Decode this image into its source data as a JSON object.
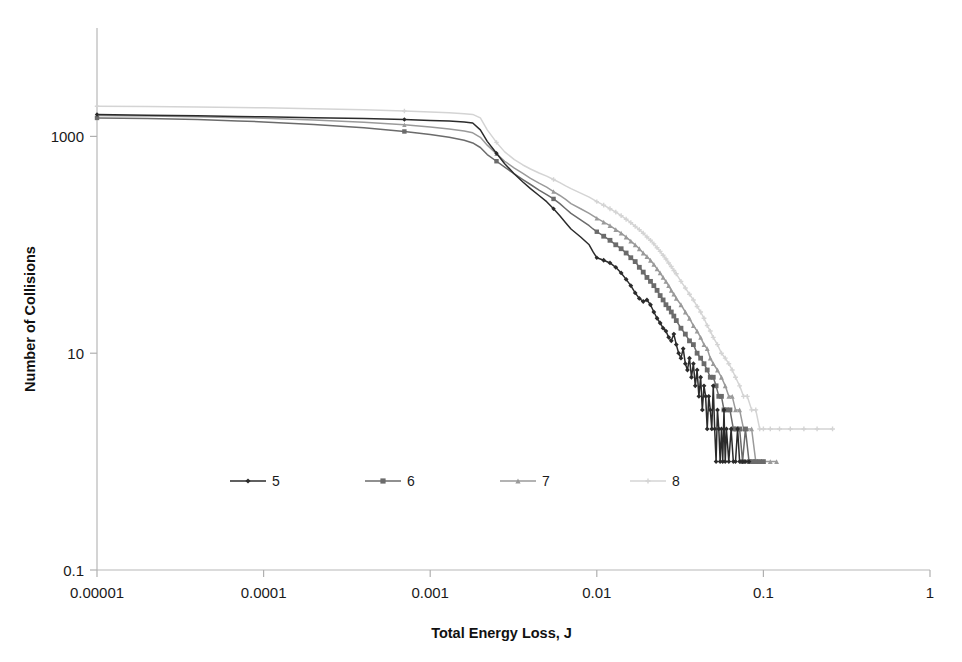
{
  "chart_data": {
    "type": "line",
    "title": "",
    "xlabel": "Total Energy Loss, J",
    "ylabel": "Number of Collisions",
    "xscale": "log",
    "yscale": "log",
    "xlim": [
      1e-05,
      1
    ],
    "ylim": [
      0.1,
      10000
    ],
    "xticks": [
      "0.00001",
      "0.0001",
      "0.001",
      "0.01",
      "0.1",
      "1"
    ],
    "xtick_values": [
      1e-05,
      0.0001,
      0.001,
      0.01,
      0.1,
      1
    ],
    "yticks": [
      "0.1",
      "10",
      "1000"
    ],
    "ytick_values": [
      0.1,
      10,
      1000
    ],
    "grid": false,
    "legend_position": "inside-lower-left",
    "legend_entries": [
      "5",
      "6",
      "7",
      "8"
    ],
    "series": [
      {
        "name": "5",
        "color": "#2b2b2b",
        "marker": "diamond",
        "points": [
          [
            1e-05,
            1590
          ],
          [
            2e-05,
            1570
          ],
          [
            4e-05,
            1550
          ],
          [
            7e-05,
            1530
          ],
          [
            0.0001,
            1515
          ],
          [
            0.0002,
            1490
          ],
          [
            0.0004,
            1460
          ],
          [
            0.0007,
            1430
          ],
          [
            0.001,
            1405
          ],
          [
            0.0013,
            1385
          ],
          [
            0.0016,
            1360
          ],
          [
            0.0018,
            1330
          ],
          [
            0.002,
            1150
          ],
          [
            0.0022,
            900
          ],
          [
            0.0025,
            700
          ],
          [
            0.0028,
            560
          ],
          [
            0.0032,
            450
          ],
          [
            0.0036,
            380
          ],
          [
            0.004,
            330
          ],
          [
            0.0045,
            285
          ],
          [
            0.005,
            250
          ],
          [
            0.0055,
            215
          ],
          [
            0.006,
            185
          ],
          [
            0.0065,
            160
          ],
          [
            0.007,
            140
          ],
          [
            0.008,
            118
          ],
          [
            0.009,
            100
          ],
          [
            0.0095,
            86
          ],
          [
            0.01,
            76
          ],
          [
            0.011,
            72
          ],
          [
            0.012,
            68
          ],
          [
            0.013,
            62
          ],
          [
            0.014,
            55
          ],
          [
            0.015,
            48
          ],
          [
            0.016,
            42
          ],
          [
            0.017,
            36
          ],
          [
            0.018,
            32
          ],
          [
            0.019,
            30
          ],
          [
            0.02,
            31
          ],
          [
            0.021,
            28
          ],
          [
            0.022,
            24
          ],
          [
            0.023,
            21
          ],
          [
            0.024,
            19
          ],
          [
            0.025,
            17
          ],
          [
            0.026,
            16
          ],
          [
            0.027,
            14
          ],
          [
            0.028,
            13
          ],
          [
            0.029,
            15
          ],
          [
            0.03,
            12
          ],
          [
            0.031,
            10
          ],
          [
            0.032,
            9
          ],
          [
            0.033,
            11
          ],
          [
            0.034,
            8
          ],
          [
            0.035,
            7
          ],
          [
            0.036,
            9
          ],
          [
            0.037,
            6
          ],
          [
            0.038,
            8
          ],
          [
            0.039,
            5
          ],
          [
            0.04,
            7
          ],
          [
            0.041,
            4
          ],
          [
            0.042,
            6
          ],
          [
            0.043,
            3
          ],
          [
            0.044,
            5
          ],
          [
            0.045,
            4
          ],
          [
            0.046,
            2
          ],
          [
            0.047,
            4
          ],
          [
            0.048,
            3
          ],
          [
            0.049,
            2
          ],
          [
            0.05,
            5
          ],
          [
            0.051,
            2
          ],
          [
            0.052,
            1
          ],
          [
            0.053,
            3
          ],
          [
            0.054,
            2
          ],
          [
            0.055,
            1
          ],
          [
            0.056,
            2
          ],
          [
            0.057,
            1
          ],
          [
            0.058,
            3
          ],
          [
            0.059,
            1
          ],
          [
            0.06,
            2
          ],
          [
            0.062,
            1
          ],
          [
            0.064,
            2
          ],
          [
            0.066,
            1
          ],
          [
            0.068,
            1
          ],
          [
            0.07,
            2
          ],
          [
            0.072,
            1
          ],
          [
            0.075,
            1
          ],
          [
            0.078,
            1
          ],
          [
            0.082,
            1
          ]
        ]
      },
      {
        "name": "6",
        "color": "#6b6b6b",
        "marker": "square",
        "points": [
          [
            1e-05,
            1480
          ],
          [
            2e-05,
            1460
          ],
          [
            4e-05,
            1430
          ],
          [
            7e-05,
            1390
          ],
          [
            0.0001,
            1360
          ],
          [
            0.0002,
            1290
          ],
          [
            0.0004,
            1200
          ],
          [
            0.0007,
            1110
          ],
          [
            0.001,
            1040
          ],
          [
            0.0013,
            980
          ],
          [
            0.0016,
            920
          ],
          [
            0.0018,
            870
          ],
          [
            0.002,
            790
          ],
          [
            0.0022,
            680
          ],
          [
            0.0025,
            590
          ],
          [
            0.0028,
            520
          ],
          [
            0.0032,
            450
          ],
          [
            0.0036,
            400
          ],
          [
            0.004,
            360
          ],
          [
            0.0045,
            320
          ],
          [
            0.005,
            290
          ],
          [
            0.0055,
            265
          ],
          [
            0.006,
            240
          ],
          [
            0.0065,
            215
          ],
          [
            0.007,
            195
          ],
          [
            0.008,
            170
          ],
          [
            0.009,
            150
          ],
          [
            0.0095,
            140
          ],
          [
            0.01,
            132
          ],
          [
            0.011,
            120
          ],
          [
            0.012,
            110
          ],
          [
            0.013,
            100
          ],
          [
            0.014,
            92
          ],
          [
            0.015,
            84
          ],
          [
            0.016,
            76
          ],
          [
            0.017,
            70
          ],
          [
            0.018,
            62
          ],
          [
            0.019,
            56
          ],
          [
            0.02,
            50
          ],
          [
            0.021,
            46
          ],
          [
            0.022,
            42
          ],
          [
            0.023,
            38
          ],
          [
            0.024,
            34
          ],
          [
            0.025,
            31
          ],
          [
            0.026,
            28
          ],
          [
            0.027,
            26
          ],
          [
            0.028,
            24
          ],
          [
            0.029,
            22
          ],
          [
            0.03,
            20
          ],
          [
            0.032,
            17
          ],
          [
            0.034,
            15
          ],
          [
            0.036,
            13
          ],
          [
            0.038,
            12
          ],
          [
            0.04,
            10
          ],
          [
            0.042,
            9
          ],
          [
            0.044,
            8
          ],
          [
            0.046,
            7
          ],
          [
            0.048,
            6
          ],
          [
            0.05,
            6
          ],
          [
            0.052,
            5
          ],
          [
            0.054,
            4
          ],
          [
            0.056,
            4
          ],
          [
            0.058,
            3
          ],
          [
            0.06,
            3
          ],
          [
            0.063,
            3
          ],
          [
            0.066,
            2
          ],
          [
            0.069,
            2
          ],
          [
            0.072,
            2
          ],
          [
            0.075,
            1
          ],
          [
            0.078,
            2
          ],
          [
            0.082,
            1
          ],
          [
            0.086,
            1
          ],
          [
            0.09,
            1
          ],
          [
            0.095,
            1
          ],
          [
            0.1,
            1
          ]
        ]
      },
      {
        "name": "7",
        "color": "#9a9a9a",
        "marker": "triangle",
        "points": [
          [
            1e-05,
            1560
          ],
          [
            2e-05,
            1545
          ],
          [
            4e-05,
            1520
          ],
          [
            7e-05,
            1490
          ],
          [
            0.0001,
            1470
          ],
          [
            0.0002,
            1420
          ],
          [
            0.0004,
            1350
          ],
          [
            0.0007,
            1280
          ],
          [
            0.001,
            1220
          ],
          [
            0.0013,
            1170
          ],
          [
            0.0016,
            1120
          ],
          [
            0.0018,
            1080
          ],
          [
            0.002,
            980
          ],
          [
            0.0022,
            830
          ],
          [
            0.0025,
            690
          ],
          [
            0.0028,
            590
          ],
          [
            0.0032,
            510
          ],
          [
            0.0036,
            455
          ],
          [
            0.004,
            410
          ],
          [
            0.0045,
            370
          ],
          [
            0.005,
            340
          ],
          [
            0.0055,
            310
          ],
          [
            0.006,
            285
          ],
          [
            0.0065,
            262
          ],
          [
            0.007,
            240
          ],
          [
            0.008,
            215
          ],
          [
            0.009,
            195
          ],
          [
            0.0095,
            185
          ],
          [
            0.01,
            176
          ],
          [
            0.011,
            162
          ],
          [
            0.012,
            150
          ],
          [
            0.013,
            138
          ],
          [
            0.014,
            128
          ],
          [
            0.015,
            118
          ],
          [
            0.016,
            108
          ],
          [
            0.017,
            100
          ],
          [
            0.018,
            92
          ],
          [
            0.019,
            84
          ],
          [
            0.02,
            78
          ],
          [
            0.021,
            72
          ],
          [
            0.022,
            66
          ],
          [
            0.023,
            60
          ],
          [
            0.024,
            55
          ],
          [
            0.025,
            50
          ],
          [
            0.026,
            46
          ],
          [
            0.027,
            42
          ],
          [
            0.028,
            38
          ],
          [
            0.029,
            35
          ],
          [
            0.03,
            32
          ],
          [
            0.032,
            28
          ],
          [
            0.034,
            24
          ],
          [
            0.036,
            21
          ],
          [
            0.038,
            18
          ],
          [
            0.04,
            16
          ],
          [
            0.042,
            14
          ],
          [
            0.044,
            12
          ],
          [
            0.046,
            11
          ],
          [
            0.048,
            9
          ],
          [
            0.05,
            8
          ],
          [
            0.053,
            7
          ],
          [
            0.056,
            6
          ],
          [
            0.059,
            5
          ],
          [
            0.062,
            4
          ],
          [
            0.065,
            4
          ],
          [
            0.068,
            3
          ],
          [
            0.072,
            3
          ],
          [
            0.076,
            2
          ],
          [
            0.08,
            2
          ],
          [
            0.085,
            2
          ],
          [
            0.09,
            1
          ],
          [
            0.095,
            1
          ],
          [
            0.1,
            1
          ],
          [
            0.11,
            1
          ],
          [
            0.12,
            1
          ]
        ]
      },
      {
        "name": "8",
        "color": "#d4d4d4",
        "marker": "cross",
        "points": [
          [
            1e-05,
            1900
          ],
          [
            2e-05,
            1890
          ],
          [
            4e-05,
            1870
          ],
          [
            7e-05,
            1850
          ],
          [
            0.0001,
            1835
          ],
          [
            0.0002,
            1800
          ],
          [
            0.0004,
            1760
          ],
          [
            0.0007,
            1715
          ],
          [
            0.001,
            1680
          ],
          [
            0.0013,
            1650
          ],
          [
            0.0016,
            1620
          ],
          [
            0.0018,
            1595
          ],
          [
            0.002,
            1480
          ],
          [
            0.0022,
            1150
          ],
          [
            0.0025,
            880
          ],
          [
            0.0028,
            720
          ],
          [
            0.0032,
            610
          ],
          [
            0.0036,
            545
          ],
          [
            0.004,
            500
          ],
          [
            0.0045,
            460
          ],
          [
            0.005,
            430
          ],
          [
            0.0055,
            400
          ],
          [
            0.006,
            375
          ],
          [
            0.0065,
            350
          ],
          [
            0.007,
            330
          ],
          [
            0.008,
            300
          ],
          [
            0.009,
            275
          ],
          [
            0.0095,
            262
          ],
          [
            0.01,
            250
          ],
          [
            0.011,
            232
          ],
          [
            0.012,
            215
          ],
          [
            0.013,
            200
          ],
          [
            0.014,
            186
          ],
          [
            0.015,
            172
          ],
          [
            0.016,
            160
          ],
          [
            0.017,
            148
          ],
          [
            0.018,
            138
          ],
          [
            0.019,
            128
          ],
          [
            0.02,
            118
          ],
          [
            0.021,
            110
          ],
          [
            0.022,
            102
          ],
          [
            0.023,
            94
          ],
          [
            0.024,
            87
          ],
          [
            0.025,
            80
          ],
          [
            0.026,
            74
          ],
          [
            0.027,
            68
          ],
          [
            0.028,
            63
          ],
          [
            0.029,
            58
          ],
          [
            0.03,
            54
          ],
          [
            0.032,
            46
          ],
          [
            0.034,
            40
          ],
          [
            0.036,
            35
          ],
          [
            0.038,
            31
          ],
          [
            0.04,
            27
          ],
          [
            0.042,
            24
          ],
          [
            0.044,
            21
          ],
          [
            0.046,
            18
          ],
          [
            0.048,
            16
          ],
          [
            0.05,
            14
          ],
          [
            0.053,
            12
          ],
          [
            0.056,
            10
          ],
          [
            0.059,
            9
          ],
          [
            0.062,
            8
          ],
          [
            0.065,
            7
          ],
          [
            0.068,
            6
          ],
          [
            0.072,
            5
          ],
          [
            0.076,
            4
          ],
          [
            0.08,
            4
          ],
          [
            0.085,
            3
          ],
          [
            0.09,
            3
          ],
          [
            0.095,
            2
          ],
          [
            0.1,
            2
          ],
          [
            0.11,
            2
          ],
          [
            0.125,
            2
          ],
          [
            0.145,
            2
          ],
          [
            0.175,
            2
          ],
          [
            0.21,
            2
          ],
          [
            0.26,
            2
          ]
        ]
      }
    ]
  }
}
